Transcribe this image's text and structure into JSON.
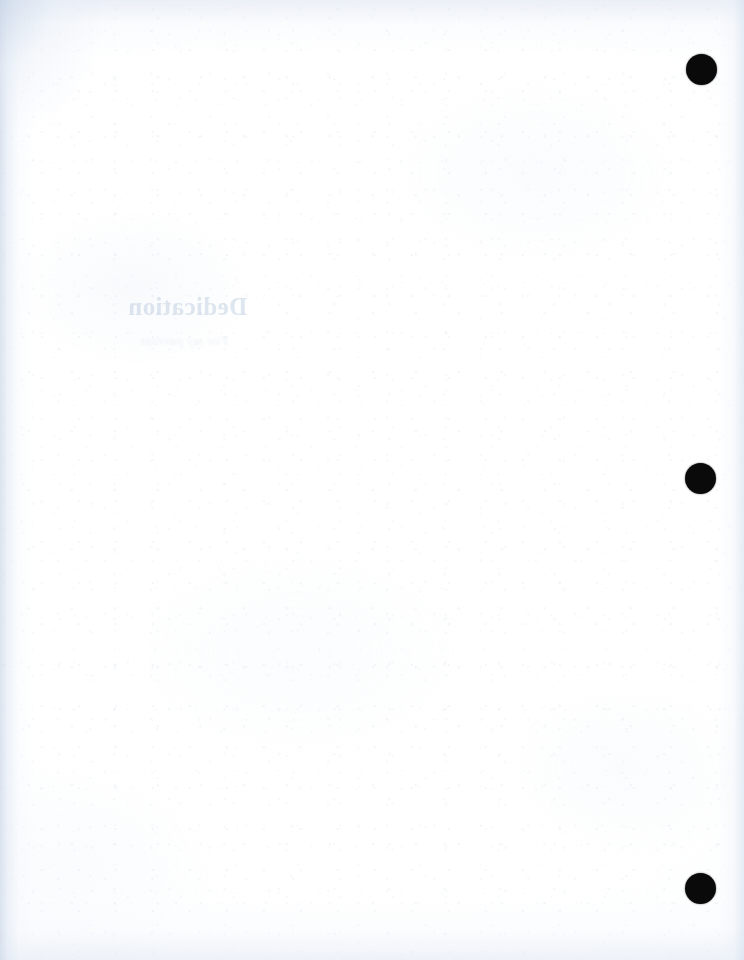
{
  "document": {
    "page_type": "blank-verso-scan",
    "page_label": "",
    "body_text": "",
    "background_color": "#fdfdfe",
    "edge_tint_color": "#ccd8e8",
    "paper_tint_color": "#f2f5fa"
  },
  "bleed_through": {
    "note": "Mirrored show-through ink from the reverse face of the sheet",
    "heading": "Dedication",
    "subline": "For my parents",
    "heading_color": "#96b0ce",
    "subline_color": "#b0c4da"
  },
  "punch_holes": {
    "color": "#0a0a0a",
    "diameter": 31,
    "items": [
      {
        "name": "punch-hole-top",
        "cx": 701,
        "cy": 69,
        "d": 31
      },
      {
        "name": "punch-hole-middle",
        "cx": 700,
        "cy": 478,
        "d": 31
      },
      {
        "name": "punch-hole-bottom",
        "cx": 700,
        "cy": 888,
        "d": 31
      }
    ]
  }
}
